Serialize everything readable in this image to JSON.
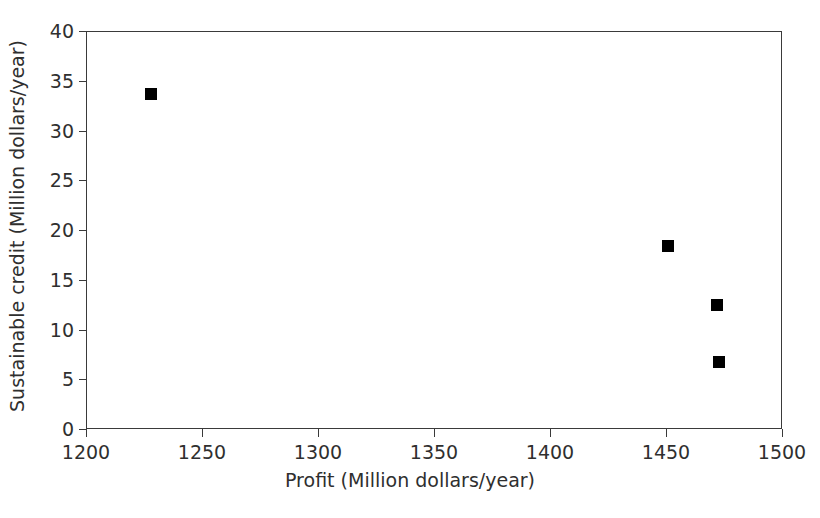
{
  "chart_data": {
    "type": "scatter",
    "title": "",
    "xlabel": "Profit (Million dollars/year)",
    "ylabel": "Sustainable credit (Million dollars/year)",
    "xlim": [
      1200,
      1500
    ],
    "ylim": [
      0,
      40
    ],
    "xticks": [
      1200,
      1250,
      1300,
      1350,
      1400,
      1450,
      1500
    ],
    "yticks": [
      0,
      5,
      10,
      15,
      20,
      25,
      30,
      35,
      40
    ],
    "xtick_labels": [
      "1200",
      "1250",
      "1300",
      "1350",
      "1400",
      "1450",
      "1500"
    ],
    "ytick_labels": [
      "0",
      "5",
      "10",
      "15",
      "20",
      "25",
      "30",
      "35",
      "40"
    ],
    "grid": false,
    "legend": false,
    "marker": "square",
    "marker_color": "#000000",
    "marker_size_px": 12,
    "series": [
      {
        "name": "Pareto solutions",
        "points": [
          {
            "x": 1228,
            "y": 33.7
          },
          {
            "x": 1451,
            "y": 18.4
          },
          {
            "x": 1472,
            "y": 12.5
          },
          {
            "x": 1473,
            "y": 6.7
          }
        ]
      }
    ]
  },
  "axis_style": {
    "frame_color": "#3a3a3a",
    "text_color": "#2f2f2f",
    "background": "#ffffff"
  }
}
